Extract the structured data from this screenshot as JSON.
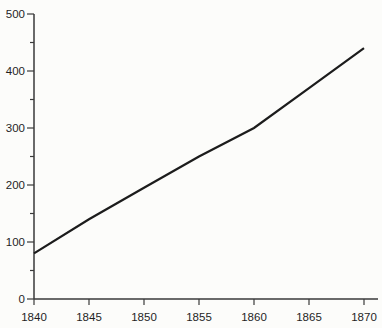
{
  "chart_data": {
    "type": "line",
    "title": "",
    "subtitle": "",
    "xlabel": "",
    "ylabel": "",
    "x": [
      1840,
      1845,
      1850,
      1855,
      1860,
      1865,
      1870
    ],
    "values": [
      80,
      140,
      195,
      250,
      300,
      370,
      440
    ],
    "xlim": [
      1840,
      1870
    ],
    "ylim": [
      0,
      500
    ],
    "x_tick_labels": [
      "1840",
      "1845",
      "1850",
      "1855",
      "1860",
      "1865",
      "1870"
    ],
    "x_ticks": [
      1840,
      1845,
      1850,
      1855,
      1860,
      1865,
      1870
    ],
    "y_ticks_major": [
      0,
      100,
      200,
      300,
      400,
      500
    ],
    "y_tick_labels": [
      "0",
      "100",
      "200",
      "300",
      "400",
      "500"
    ],
    "y_ticks_minor": [
      50,
      150,
      250,
      350,
      450
    ],
    "grid": false,
    "legend": "none",
    "line_color": "#1c1c1c",
    "axis_color": "#3a3a3a",
    "tick_color": "#3a3a3a",
    "label_color": "#1f1f1f",
    "background_color": "#fcfcfa"
  }
}
